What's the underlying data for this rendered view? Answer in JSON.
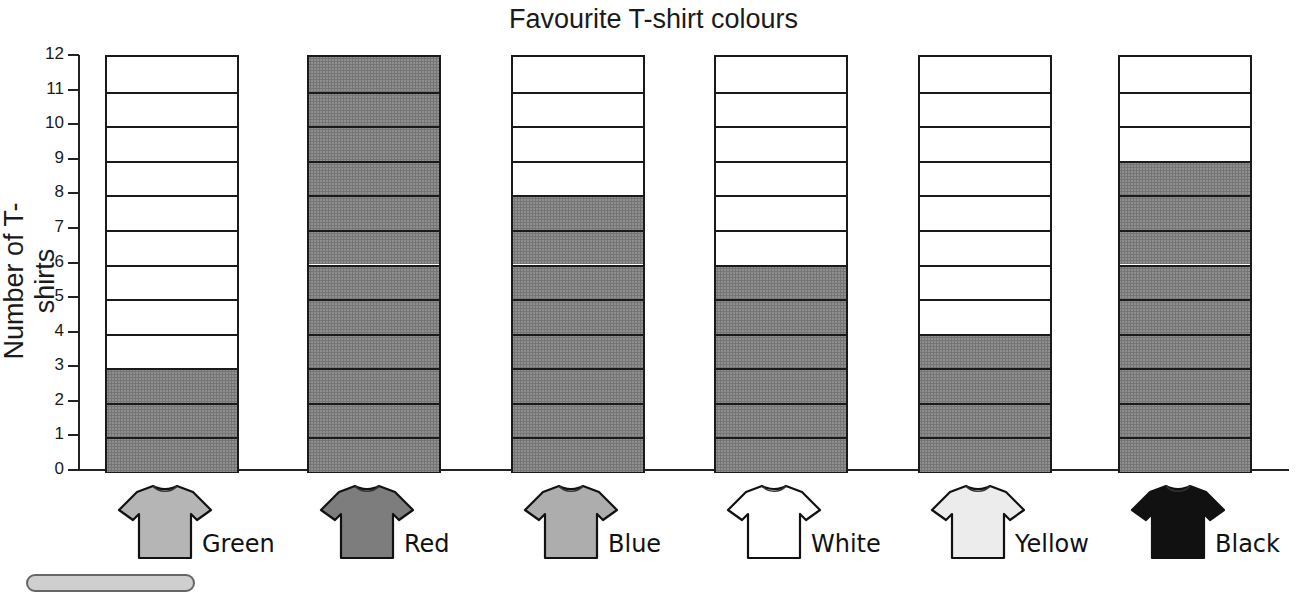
{
  "chart_data": {
    "type": "bar",
    "title": "Favourite T-shirt colours",
    "xlabel": "",
    "ylabel": "Number of T-shirts",
    "categories": [
      "Green",
      "Red",
      "Blue",
      "White",
      "Yellow",
      "Black"
    ],
    "values": [
      3,
      12,
      8,
      6,
      4,
      9
    ],
    "ylim": [
      0,
      12
    ],
    "yticks": [
      "0",
      "1",
      "2",
      "3",
      "4",
      "5",
      "6",
      "7",
      "8",
      "9",
      "10",
      "11",
      "12"
    ],
    "grid": false,
    "legend": "none",
    "bar_style": "stacked unit cells, shaded grey for counted units, white for remaining up to 12",
    "category_icons": [
      {
        "label": "Green",
        "icon": "t-shirt-icon",
        "fill": "#b5b5b5"
      },
      {
        "label": "Red",
        "icon": "t-shirt-icon",
        "fill": "#7d7d7d"
      },
      {
        "label": "Blue",
        "icon": "t-shirt-icon",
        "fill": "#adadad"
      },
      {
        "label": "White",
        "icon": "t-shirt-icon",
        "fill": "#ffffff"
      },
      {
        "label": "Yellow",
        "icon": "t-shirt-icon",
        "fill": "#ececec"
      },
      {
        "label": "Black",
        "icon": "t-shirt-icon",
        "fill": "#111111"
      }
    ]
  },
  "colors": {
    "filled_cell": "#8f8f8f",
    "empty_cell": "#ffffff",
    "outline": "#1a1a1a"
  }
}
